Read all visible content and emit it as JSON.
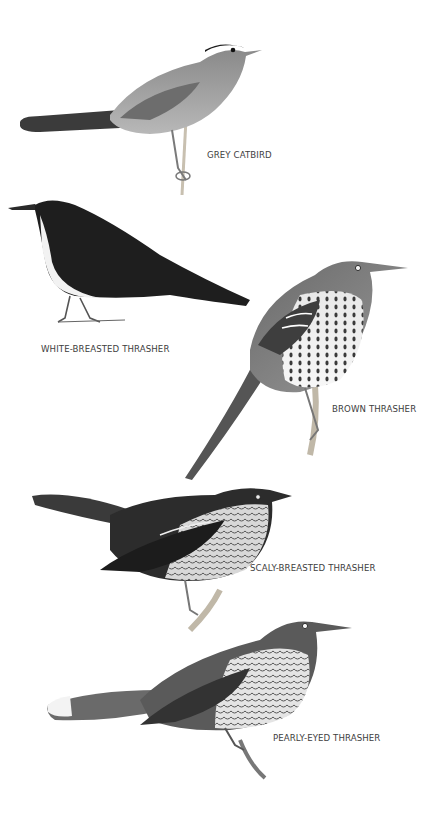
{
  "plate": {
    "background": "#ffffff",
    "birds": [
      {
        "id": "grey-catbird",
        "label": "GREY CATBIRD",
        "plumage": "grey"
      },
      {
        "id": "white-breasted-thrasher",
        "label": "WHITE-BREASTED THRASHER",
        "plumage": "dark with white breast"
      },
      {
        "id": "brown-thrasher",
        "label": "BROWN THRASHER",
        "plumage": "brown with streaked breast"
      },
      {
        "id": "scaly-breasted-thrasher",
        "label": "SCALY-BREASTED THRASHER",
        "plumage": "dark with scaled breast"
      },
      {
        "id": "pearly-eyed-thrasher",
        "label": "PEARLY-EYED THRASHER",
        "plumage": "brown with scaled breast, white tail tips"
      }
    ]
  }
}
